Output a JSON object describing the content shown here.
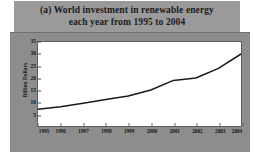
{
  "figure": {
    "panel_color": "#8d8d8d",
    "title_band_color": "#9a9a9a",
    "plot_background": "#ffffff",
    "line_color": "#1a1a1a"
  },
  "title": {
    "line1": "(a) World investment in renewable energy",
    "line2": "each year from 1995 to 2004"
  },
  "chart_data": {
    "type": "line",
    "title": "(a) World investment in renewable energy each year from 1995 to 2004",
    "xlabel": "",
    "ylabel": "Billion Dollars",
    "categories": [
      "1995",
      "1996",
      "1997",
      "1998",
      "1999",
      "2000",
      "2001",
      "2002",
      "2003",
      "2004"
    ],
    "values": [
      7,
      8,
      9.5,
      11,
      12.5,
      15,
      19,
      20,
      24,
      30
    ],
    "ylim": [
      0,
      35
    ],
    "yticks": [
      5,
      10,
      15,
      20,
      25,
      30,
      35
    ],
    "ytick_labels": [
      "5",
      "10",
      "15",
      "20",
      "25",
      "30",
      "35"
    ],
    "grid": false,
    "legend": false,
    "series": [
      {
        "name": "World investment in renewable energy",
        "values": [
          7,
          8,
          9.5,
          11,
          12.5,
          15,
          19,
          20,
          24,
          30
        ]
      }
    ]
  }
}
